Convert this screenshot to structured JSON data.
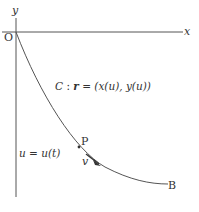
{
  "diagram": {
    "axes": {
      "x_label": "x",
      "y_label": "y",
      "origin_label": "O"
    },
    "curve": {
      "label": "C : r = (x(u), y(u))",
      "label_parts": {
        "name": "C",
        "colon": " : ",
        "vector": "r",
        "rest": " = (x(u), y(u))"
      },
      "end_label": "B"
    },
    "point": {
      "label": "P",
      "parameter_label": "u = u(t)",
      "velocity_label": "v"
    },
    "colors": {
      "line": "#555555",
      "text": "#333333",
      "background": "#ffffff"
    }
  }
}
